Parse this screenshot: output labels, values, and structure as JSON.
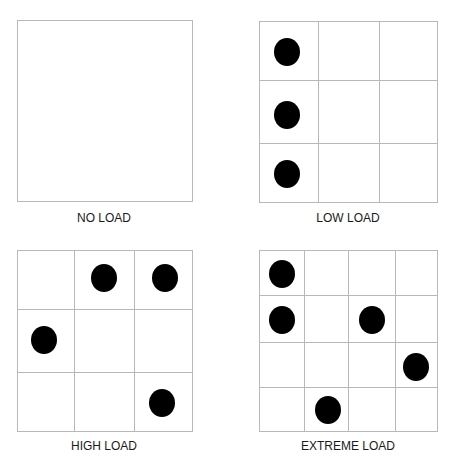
{
  "panels": [
    {
      "id": "no-load",
      "label": "NO LOAD",
      "box": {
        "x": 17,
        "y": 20,
        "w": 175,
        "h": 181
      },
      "col_lines": [],
      "row_lines": [],
      "dots": []
    },
    {
      "id": "low-load",
      "label": "LOW LOAD",
      "box": {
        "x": 259,
        "y": 21,
        "w": 178,
        "h": 181
      },
      "col_lines": [
        318,
        379
      ],
      "row_lines": [
        80,
        143
      ],
      "dots": [
        {
          "cx": 287,
          "cy": 52
        },
        {
          "cx": 287,
          "cy": 115
        },
        {
          "cx": 287,
          "cy": 174
        }
      ]
    },
    {
      "id": "high-load",
      "label": "HIGH LOAD",
      "box": {
        "x": 17,
        "y": 250,
        "w": 175,
        "h": 181
      },
      "col_lines": [
        74,
        134
      ],
      "row_lines": [
        309,
        372
      ],
      "dots": [
        {
          "cx": 104,
          "cy": 278
        },
        {
          "cx": 165,
          "cy": 278
        },
        {
          "cx": 44,
          "cy": 340
        },
        {
          "cx": 162,
          "cy": 403
        }
      ]
    },
    {
      "id": "extreme-load",
      "label": "EXTREME LOAD",
      "box": {
        "x": 259,
        "y": 250,
        "w": 178,
        "h": 181
      },
      "col_lines": [
        304,
        348,
        395
      ],
      "row_lines": [
        295,
        342,
        387
      ],
      "dots": [
        {
          "cx": 282,
          "cy": 274
        },
        {
          "cx": 282,
          "cy": 320
        },
        {
          "cx": 372,
          "cy": 320
        },
        {
          "cx": 416,
          "cy": 367
        },
        {
          "cx": 328,
          "cy": 410
        }
      ]
    }
  ],
  "labels": {
    "no_load": "NO LOAD",
    "low_load": "LOW LOAD",
    "high_load": "HIGH LOAD",
    "extreme_load": "EXTREME LOAD"
  },
  "style": {
    "grid_color": "#b8b8b8",
    "dot_color": "#000000",
    "dot_rx": 13,
    "dot_ry": 14
  }
}
